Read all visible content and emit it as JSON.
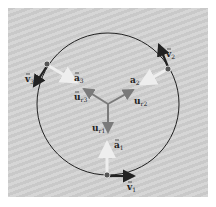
{
  "diagram": {
    "colors": {
      "background": "#ffffff",
      "panel": "#cfcfcf",
      "circle": "#222222",
      "velocity_arrow": "#222222",
      "acceleration_arrow": "#e6e6e6",
      "unit_vector_arrow": "#7a7a7a",
      "particle": "#555555"
    },
    "center": {
      "x": 108,
      "y": 104
    },
    "radius": 71,
    "particles": [
      {
        "id": 1,
        "x": 107,
        "y": 175,
        "velocity_label": "v",
        "velocity_sub": "1",
        "accel_label": "a",
        "accel_sub": "1",
        "unit_label": "u",
        "unit_sub": "r1"
      },
      {
        "id": 2,
        "x": 168,
        "y": 69,
        "velocity_label": "v",
        "velocity_sub": "2",
        "accel_label": "a",
        "accel_sub": "2",
        "unit_label": "u",
        "unit_sub": "r2"
      },
      {
        "id": 3,
        "x": 47,
        "y": 64,
        "velocity_label": "v",
        "velocity_sub": "3",
        "accel_label": "a",
        "accel_sub": "3",
        "unit_label": "u",
        "unit_sub": "r3"
      }
    ],
    "labels": {
      "v1": "v",
      "v1_sub": "1",
      "v2": "v",
      "v2_sub": "2",
      "v3": "v",
      "v3_sub": "3",
      "a1": "a",
      "a1_sub": "1",
      "a2": "a",
      "a2_sub": "2",
      "a3": "a",
      "a3_sub": "3",
      "u1": "u",
      "u1_sub": "r1",
      "u2": "u",
      "u2_sub": "r2",
      "u3": "u",
      "u3_sub": "r3"
    }
  }
}
